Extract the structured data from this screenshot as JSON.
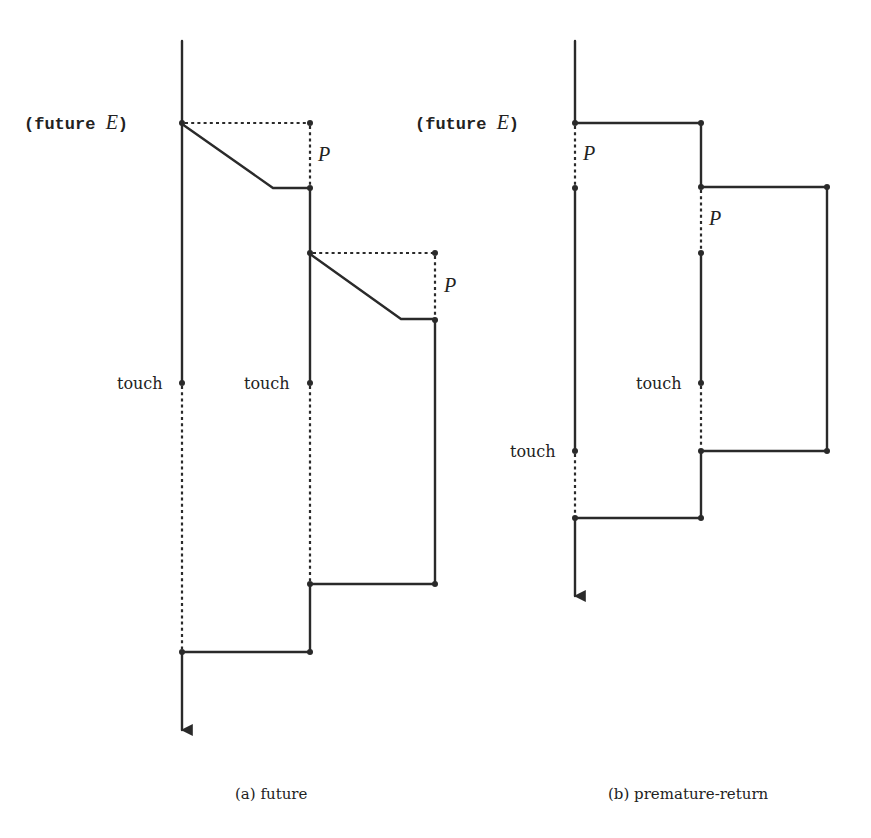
{
  "figure": {
    "panels": [
      {
        "id": "a",
        "caption": "(a) future",
        "labels": {
          "fork": "(future ",
          "fork_var": "E",
          "fork_close": ")",
          "p1": "P",
          "p2": "P",
          "touch1": "touch",
          "touch2": "touch"
        }
      },
      {
        "id": "b",
        "caption": "(b) premature-return",
        "labels": {
          "fork": "(future ",
          "fork_var": "E",
          "fork_close": ")",
          "p1": "P",
          "p2": "P",
          "touch1": "touch",
          "touch2": "touch"
        }
      }
    ],
    "colors": {
      "ink": "#2a2a2a",
      "background": "#ffffff"
    }
  }
}
